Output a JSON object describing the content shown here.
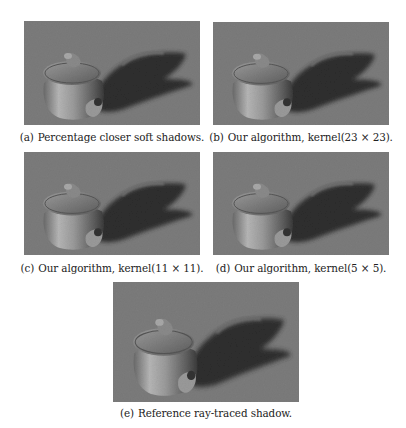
{
  "figure": {
    "panels": [
      {
        "id": "a",
        "label": "(a)",
        "caption": "Percentage closer soft shadows.",
        "image": "teapot-soft-shadow-render"
      },
      {
        "id": "b",
        "label": "(b)",
        "caption": "Our algorithm, kernel(23 × 23).",
        "image": "teapot-soft-shadow-render"
      },
      {
        "id": "c",
        "label": "(c)",
        "caption": "Our algorithm, kernel(11 × 11).",
        "image": "teapot-soft-shadow-render"
      },
      {
        "id": "d",
        "label": "(d)",
        "caption": "Our algorithm, kernel(5 × 5).",
        "image": "teapot-soft-shadow-render"
      },
      {
        "id": "e",
        "label": "(e)",
        "caption": "Reference ray-traced shadow.",
        "image": "teapot-soft-shadow-render"
      }
    ],
    "colors": {
      "background": "#7c7c7c",
      "shadow": "#2e2e2e",
      "teapot_light": "#b8b8b8",
      "teapot_dark": "#4a4a4a"
    }
  }
}
